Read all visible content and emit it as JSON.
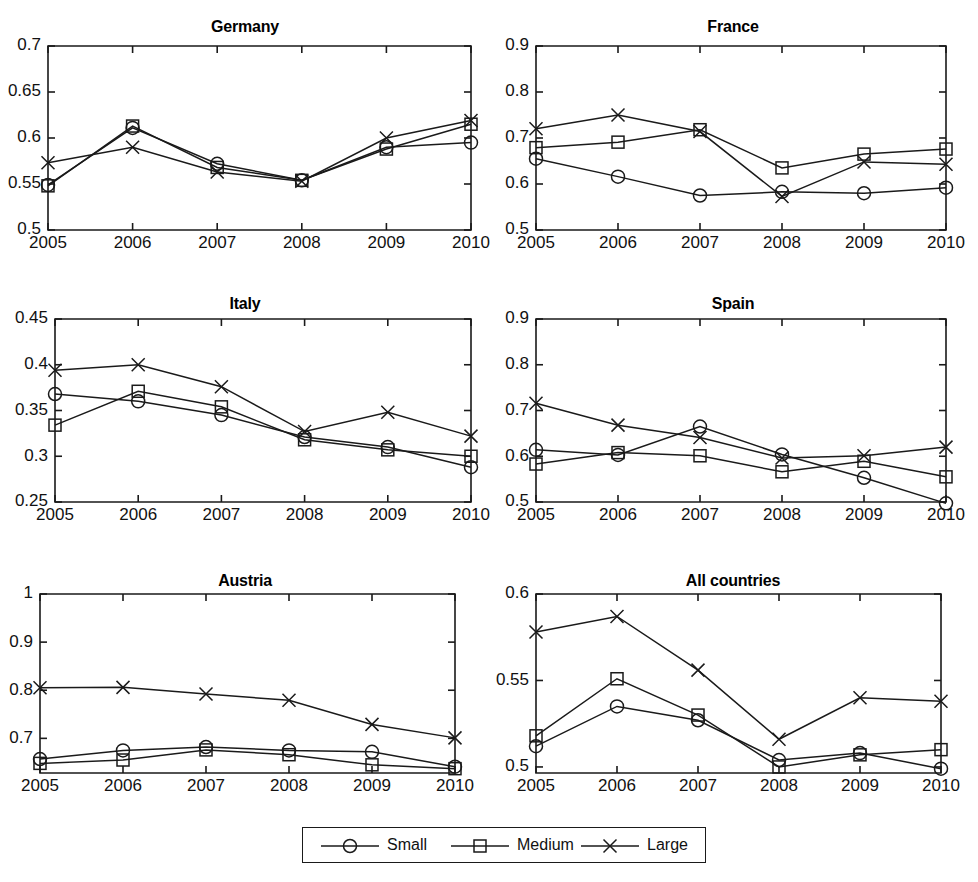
{
  "figure": {
    "background_color": "#ffffff",
    "line_color": "#1a1a1a",
    "panel_count": 6
  },
  "legend": {
    "items": [
      {
        "label": "Small",
        "marker": "circle-marker"
      },
      {
        "label": "Medium",
        "marker": "square-marker"
      },
      {
        "label": "Large",
        "marker": "cross-marker"
      }
    ]
  },
  "chart_data": [
    {
      "type": "line",
      "title": "Germany",
      "xlabel": "",
      "ylabel": "",
      "x": [
        2005,
        2006,
        2007,
        2008,
        2009,
        2010
      ],
      "categories": [
        "2005",
        "2006",
        "2007",
        "2008",
        "2009",
        "2010"
      ],
      "yticks": [
        0.5,
        0.55,
        0.6,
        0.65,
        0.7
      ],
      "ytick_labels": [
        "0.5",
        "0.55",
        "0.6",
        "0.65",
        "0.7"
      ],
      "ylim": [
        0.5,
        0.7
      ],
      "grid": false,
      "legend_position": "figure-bottom-center",
      "series": [
        {
          "name": "Small",
          "marker": "circle-marker",
          "values": [
            0.549,
            0.611,
            0.572,
            0.554,
            0.59,
            0.595
          ]
        },
        {
          "name": "Medium",
          "marker": "square-marker",
          "values": [
            0.548,
            0.613,
            0.568,
            0.554,
            0.588,
            0.615
          ]
        },
        {
          "name": "Large",
          "marker": "cross-marker",
          "values": [
            0.573,
            0.59,
            0.563,
            0.553,
            0.6,
            0.619
          ]
        }
      ]
    },
    {
      "type": "line",
      "title": "France",
      "xlabel": "",
      "ylabel": "",
      "x": [
        2005,
        2006,
        2007,
        2008,
        2009,
        2010
      ],
      "categories": [
        "2005",
        "2006",
        "2007",
        "2008",
        "2009",
        "2010"
      ],
      "yticks": [
        0.5,
        0.6,
        0.7,
        0.8,
        0.9
      ],
      "ytick_labels": [
        "0.5",
        "0.6",
        "0.7",
        "0.8",
        "0.9"
      ],
      "ylim": [
        0.5,
        0.9
      ],
      "grid": false,
      "legend_position": "figure-bottom-center",
      "series": [
        {
          "name": "Small",
          "marker": "circle-marker",
          "values": [
            0.655,
            0.616,
            0.575,
            0.583,
            0.58,
            0.592
          ]
        },
        {
          "name": "Medium",
          "marker": "square-marker",
          "values": [
            0.679,
            0.691,
            0.718,
            0.635,
            0.665,
            0.676
          ]
        },
        {
          "name": "Large",
          "marker": "cross-marker",
          "values": [
            0.72,
            0.75,
            0.714,
            0.573,
            0.648,
            0.643
          ]
        }
      ]
    },
    {
      "type": "line",
      "title": "Italy",
      "xlabel": "",
      "ylabel": "",
      "x": [
        2005,
        2006,
        2007,
        2008,
        2009,
        2010
      ],
      "categories": [
        "2005",
        "2006",
        "2007",
        "2008",
        "2009",
        "2010"
      ],
      "yticks": [
        0.25,
        0.3,
        0.35,
        0.4,
        0.45
      ],
      "ytick_labels": [
        "0.25",
        "0.3",
        "0.35",
        "0.4",
        "0.45"
      ],
      "ylim": [
        0.25,
        0.45
      ],
      "grid": false,
      "legend_position": "figure-bottom-center",
      "series": [
        {
          "name": "Small",
          "marker": "circle-marker",
          "values": [
            0.368,
            0.36,
            0.345,
            0.321,
            0.31,
            0.288
          ]
        },
        {
          "name": "Medium",
          "marker": "square-marker",
          "values": [
            0.334,
            0.371,
            0.354,
            0.318,
            0.307,
            0.3
          ]
        },
        {
          "name": "Large",
          "marker": "cross-marker",
          "values": [
            0.394,
            0.4,
            0.376,
            0.327,
            0.348,
            0.322
          ]
        }
      ]
    },
    {
      "type": "line",
      "title": "Spain",
      "xlabel": "",
      "ylabel": "",
      "x": [
        2005,
        2006,
        2007,
        2008,
        2009,
        2010
      ],
      "categories": [
        "2005",
        "2006",
        "2007",
        "2008",
        "2009",
        "2010"
      ],
      "yticks": [
        0.5,
        0.6,
        0.7,
        0.8,
        0.9
      ],
      "ytick_labels": [
        "0.5",
        "0.6",
        "0.7",
        "0.8",
        "0.9"
      ],
      "ylim": [
        0.5,
        0.9
      ],
      "grid": false,
      "legend_position": "figure-bottom-center",
      "series": [
        {
          "name": "Small",
          "marker": "circle-marker",
          "values": [
            0.614,
            0.603,
            0.665,
            0.604,
            0.553,
            0.497
          ]
        },
        {
          "name": "Medium",
          "marker": "square-marker",
          "values": [
            0.583,
            0.608,
            0.601,
            0.566,
            0.589,
            0.555
          ]
        },
        {
          "name": "Large",
          "marker": "cross-marker",
          "values": [
            0.716,
            0.668,
            0.641,
            0.596,
            0.601,
            0.62
          ]
        }
      ]
    },
    {
      "type": "line",
      "title": "Austria",
      "xlabel": "",
      "ylabel": "",
      "x": [
        2005,
        2006,
        2007,
        2008,
        2009,
        2010
      ],
      "categories": [
        "2005",
        "2006",
        "2007",
        "2008",
        "2009",
        "2010"
      ],
      "yticks": [
        0.7,
        0.8,
        0.9,
        1.0
      ],
      "ytick_labels": [
        "0.7",
        "0.8",
        "0.9",
        "1"
      ],
      "ylim": [
        0.628,
        1.0
      ],
      "grid": false,
      "legend_position": "figure-bottom-center",
      "series": [
        {
          "name": "Small",
          "marker": "circle-marker",
          "values": [
            0.657,
            0.675,
            0.682,
            0.675,
            0.672,
            0.641
          ]
        },
        {
          "name": "Medium",
          "marker": "square-marker",
          "values": [
            0.648,
            0.655,
            0.676,
            0.666,
            0.645,
            0.637
          ]
        },
        {
          "name": "Large",
          "marker": "cross-marker",
          "values": [
            0.805,
            0.806,
            0.792,
            0.779,
            0.729,
            0.701
          ]
        }
      ]
    },
    {
      "type": "line",
      "title": "All countries",
      "xlabel": "",
      "ylabel": "",
      "x": [
        2005,
        2006,
        2007,
        2008,
        2009,
        2010
      ],
      "categories": [
        "2005",
        "2006",
        "2007",
        "2008",
        "2009",
        "2010"
      ],
      "yticks": [
        0.5,
        0.55,
        0.6
      ],
      "ytick_labels": [
        "0.5",
        "0.55",
        "0.6"
      ],
      "ylim": [
        0.4965,
        0.6
      ],
      "grid": false,
      "legend_position": "figure-bottom-center",
      "series": [
        {
          "name": "Small",
          "marker": "circle-marker",
          "values": [
            0.512,
            0.535,
            0.527,
            0.504,
            0.508,
            0.499
          ]
        },
        {
          "name": "Medium",
          "marker": "square-marker",
          "values": [
            0.518,
            0.551,
            0.53,
            0.5,
            0.507,
            0.51
          ]
        },
        {
          "name": "Large",
          "marker": "cross-marker",
          "values": [
            0.578,
            0.587,
            0.556,
            0.516,
            0.54,
            0.538
          ]
        }
      ]
    }
  ]
}
